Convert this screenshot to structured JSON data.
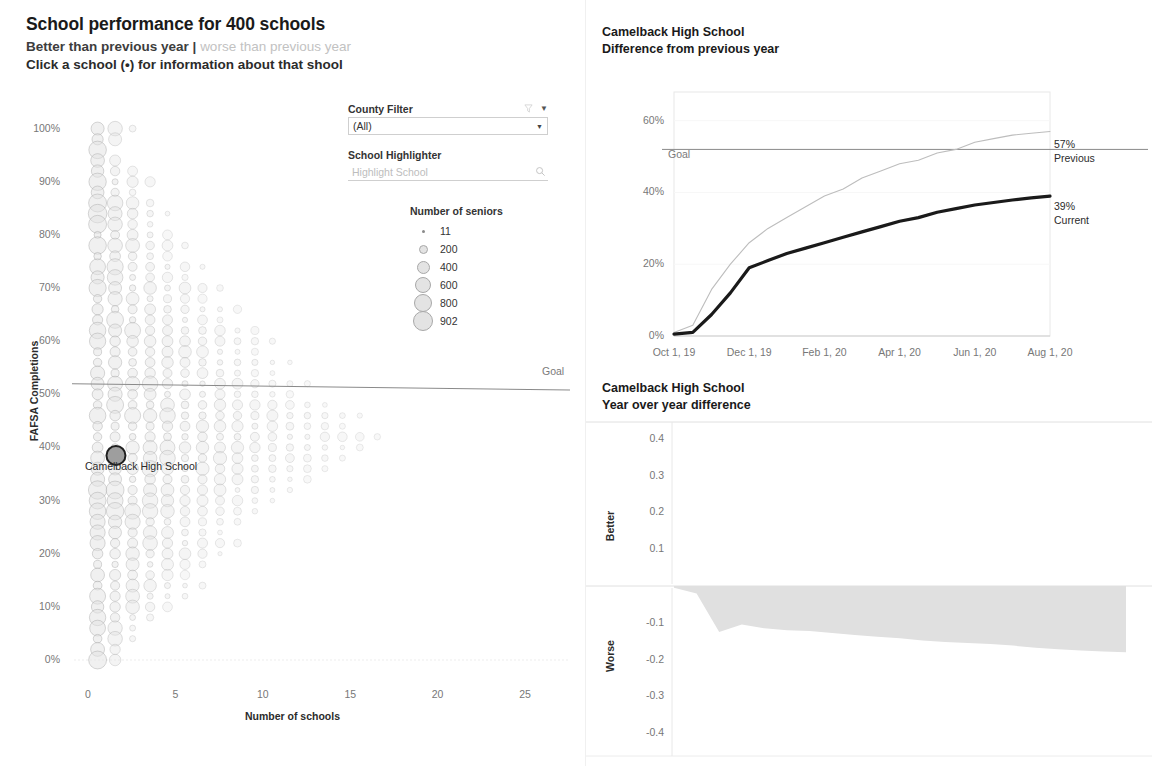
{
  "colors": {
    "ink": "#1a1a1a",
    "muted": "#777777",
    "light_gray": "#c2c2c2",
    "bubble_fill": "#e3e3e3",
    "bubble_stroke": "#a8a8a8",
    "goal_line": "#8a8a8a",
    "current_line": "#1a1a1a",
    "previous_line": "#bdbdbd",
    "area_fill": "#e0e0e0",
    "grid": "#efefef"
  },
  "left": {
    "title": "School performance for 400 schools",
    "subtitle_better": "Better than previous year",
    "subtitle_separator": "|",
    "subtitle_worse": "worse than previous year",
    "instruction": "Click a school (•) for information about that shool",
    "controls": {
      "county_filter_label": "County Filter",
      "county_filter_value": "(All)",
      "school_highlighter_label": "School Highlighter",
      "school_highlighter_placeholder": "Highlight School",
      "school_highlighter_value": ""
    },
    "size_legend": {
      "title": "Number of seniors",
      "entries": [
        {
          "value": "11",
          "d": 3
        },
        {
          "value": "200",
          "d": 9
        },
        {
          "value": "400",
          "d": 13
        },
        {
          "value": "600",
          "d": 16
        },
        {
          "value": "800",
          "d": 18
        },
        {
          "value": "902",
          "d": 20
        }
      ]
    },
    "annotation": "Camelback High School",
    "goal_label": "Goal"
  },
  "right": {
    "top_chart": {
      "title_line1": "Camelback High School",
      "title_line2": "Difference from previous year",
      "goal_label": "Goal",
      "series_labels": [
        {
          "value": "57%",
          "name": "Previous"
        },
        {
          "value": "39%",
          "name": "Current"
        }
      ]
    },
    "bottom_chart": {
      "title_line1": "Camelback High School",
      "title_line2": "Year over year difference",
      "better_label": "Better",
      "worse_label": "Worse"
    }
  },
  "chart_data": [
    {
      "id": "school-dot-plot",
      "type": "scatter",
      "title": "School performance for 400 schools",
      "xlabel": "Number of schools",
      "ylabel": "FAFSA Completions",
      "xlim": [
        0,
        27
      ],
      "ylim": [
        0,
        1.02
      ],
      "xticks": [
        0,
        5,
        10,
        15,
        20,
        25
      ],
      "xtick_labels": [
        "0",
        "5",
        "10",
        "15",
        "20",
        "25"
      ],
      "yticks": [
        0,
        0.1,
        0.2,
        0.3,
        0.4,
        0.5,
        0.6,
        0.7,
        0.8,
        0.9,
        1.0
      ],
      "ytick_labels": [
        "0%",
        "10%",
        "20%",
        "30%",
        "40%",
        "50%",
        "60%",
        "70%",
        "80%",
        "90%",
        "100%"
      ],
      "grid": false,
      "size_encoding": "Number of seniors",
      "size_legend_values": [
        11,
        200,
        400,
        600,
        800,
        902
      ],
      "goal_line": {
        "label": "Goal",
        "y_left": 0.52,
        "y_right": 0.508
      },
      "highlighted_point": {
        "label": "Camelback High School",
        "x": 1.6,
        "y": 0.385,
        "seniors": 520
      },
      "row_counts": [
        {
          "y": 1.0,
          "count": 3
        },
        {
          "y": 0.98,
          "count": 2
        },
        {
          "y": 0.96,
          "count": 1
        },
        {
          "y": 0.94,
          "count": 2
        },
        {
          "y": 0.92,
          "count": 3
        },
        {
          "y": 0.9,
          "count": 4
        },
        {
          "y": 0.88,
          "count": 3
        },
        {
          "y": 0.86,
          "count": 4
        },
        {
          "y": 0.84,
          "count": 5
        },
        {
          "y": 0.82,
          "count": 4
        },
        {
          "y": 0.8,
          "count": 5
        },
        {
          "y": 0.78,
          "count": 6
        },
        {
          "y": 0.76,
          "count": 5
        },
        {
          "y": 0.74,
          "count": 7
        },
        {
          "y": 0.72,
          "count": 6
        },
        {
          "y": 0.7,
          "count": 8
        },
        {
          "y": 0.68,
          "count": 7
        },
        {
          "y": 0.66,
          "count": 9
        },
        {
          "y": 0.64,
          "count": 8
        },
        {
          "y": 0.62,
          "count": 10
        },
        {
          "y": 0.6,
          "count": 11
        },
        {
          "y": 0.58,
          "count": 10
        },
        {
          "y": 0.56,
          "count": 12
        },
        {
          "y": 0.54,
          "count": 11
        },
        {
          "y": 0.52,
          "count": 13
        },
        {
          "y": 0.5,
          "count": 12
        },
        {
          "y": 0.48,
          "count": 14
        },
        {
          "y": 0.46,
          "count": 16
        },
        {
          "y": 0.44,
          "count": 15
        },
        {
          "y": 0.42,
          "count": 17
        },
        {
          "y": 0.4,
          "count": 16
        },
        {
          "y": 0.38,
          "count": 15
        },
        {
          "y": 0.36,
          "count": 14
        },
        {
          "y": 0.34,
          "count": 13
        },
        {
          "y": 0.32,
          "count": 12
        },
        {
          "y": 0.3,
          "count": 11
        },
        {
          "y": 0.28,
          "count": 10
        },
        {
          "y": 0.26,
          "count": 9
        },
        {
          "y": 0.24,
          "count": 8
        },
        {
          "y": 0.22,
          "count": 9
        },
        {
          "y": 0.2,
          "count": 8
        },
        {
          "y": 0.18,
          "count": 7
        },
        {
          "y": 0.16,
          "count": 6
        },
        {
          "y": 0.14,
          "count": 7
        },
        {
          "y": 0.12,
          "count": 6
        },
        {
          "y": 0.1,
          "count": 5
        },
        {
          "y": 0.08,
          "count": 4
        },
        {
          "y": 0.06,
          "count": 3
        },
        {
          "y": 0.04,
          "count": 3
        },
        {
          "y": 0.02,
          "count": 2
        },
        {
          "y": 0.0,
          "count": 2
        }
      ]
    },
    {
      "id": "difference-from-previous-year",
      "type": "line",
      "title": "Camelback High School — Difference from previous year",
      "xlabel": "",
      "ylabel": "",
      "ylim": [
        0,
        0.68
      ],
      "yticks": [
        0,
        0.2,
        0.4,
        0.6
      ],
      "ytick_labels": [
        "0%",
        "20%",
        "40%",
        "60%"
      ],
      "xtick_labels": [
        "Oct 1, 19",
        "Dec 1, 19",
        "Feb 1, 20",
        "Apr 1, 20",
        "Jun 1, 20",
        "Aug 1, 20"
      ],
      "grid": false,
      "goal_line": {
        "label": "Goal",
        "y": 0.52
      },
      "series": [
        {
          "name": "Previous",
          "end_label": "57%",
          "color": "#bdbdbd",
          "x": [
            "Oct 1, 19",
            "Oct 15, 19",
            "Nov 1, 19",
            "Nov 15, 19",
            "Dec 1, 19",
            "Dec 15, 19",
            "Jan 1, 20",
            "Jan 15, 20",
            "Feb 1, 20",
            "Feb 15, 20",
            "Mar 1, 20",
            "Mar 15, 20",
            "Apr 1, 20",
            "Apr 15, 20",
            "May 1, 20",
            "May 15, 20",
            "Jun 1, 20",
            "Jun 15, 20",
            "Jul 1, 20",
            "Jul 15, 20",
            "Aug 1, 20"
          ],
          "values": [
            0.01,
            0.03,
            0.13,
            0.2,
            0.26,
            0.3,
            0.33,
            0.36,
            0.39,
            0.41,
            0.44,
            0.46,
            0.48,
            0.49,
            0.51,
            0.52,
            0.54,
            0.55,
            0.56,
            0.565,
            0.57
          ]
        },
        {
          "name": "Current",
          "end_label": "39%",
          "color": "#1a1a1a",
          "x": [
            "Oct 1, 19",
            "Oct 15, 19",
            "Nov 1, 19",
            "Nov 15, 19",
            "Dec 1, 19",
            "Dec 15, 19",
            "Jan 1, 20",
            "Jan 15, 20",
            "Feb 1, 20",
            "Feb 15, 20",
            "Mar 1, 20",
            "Mar 15, 20",
            "Apr 1, 20",
            "Apr 15, 20",
            "May 1, 20",
            "May 15, 20",
            "Jun 1, 20",
            "Jun 15, 20",
            "Jul 1, 20",
            "Jul 15, 20",
            "Aug 1, 20"
          ],
          "values": [
            0.005,
            0.01,
            0.06,
            0.12,
            0.19,
            0.21,
            0.23,
            0.245,
            0.26,
            0.275,
            0.29,
            0.305,
            0.32,
            0.33,
            0.345,
            0.355,
            0.365,
            0.372,
            0.379,
            0.385,
            0.39
          ]
        }
      ]
    },
    {
      "id": "year-over-year-difference",
      "type": "area",
      "title": "Camelback High School — Year over year difference",
      "xlabel": "",
      "ylabel": "",
      "ylim": [
        -0.4,
        0.4
      ],
      "yticks": [
        0.4,
        0.3,
        0.2,
        0.1,
        -0.1,
        -0.2,
        -0.3,
        -0.4
      ],
      "ytick_labels": [
        "0.4",
        "0.3",
        "0.2",
        "0.1",
        "-0.1",
        "-0.2",
        "-0.3",
        "-0.4"
      ],
      "pane_labels": [
        "Better",
        "Worse"
      ],
      "grid": false,
      "baseline": 0,
      "x": [
        "Oct 1, 19",
        "Oct 15, 19",
        "Nov 1, 19",
        "Nov 15, 19",
        "Dec 1, 19",
        "Dec 15, 19",
        "Jan 1, 20",
        "Jan 15, 20",
        "Feb 1, 20",
        "Feb 15, 20",
        "Mar 1, 20",
        "Mar 15, 20",
        "Apr 1, 20",
        "Apr 15, 20",
        "May 1, 20",
        "May 15, 20",
        "Jun 1, 20",
        "Jun 15, 20",
        "Jul 1, 20",
        "Jul 15, 20",
        "Aug 1, 20"
      ],
      "values": [
        -0.005,
        -0.02,
        -0.125,
        -0.105,
        -0.115,
        -0.12,
        -0.122,
        -0.128,
        -0.133,
        -0.138,
        -0.142,
        -0.148,
        -0.152,
        -0.155,
        -0.158,
        -0.162,
        -0.168,
        -0.172,
        -0.175,
        -0.178,
        -0.18
      ]
    }
  ]
}
